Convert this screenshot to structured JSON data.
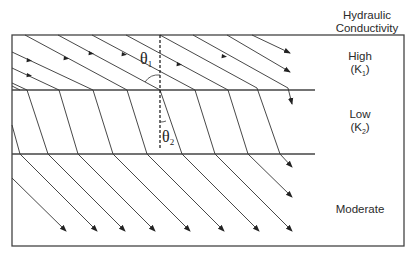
{
  "figure": {
    "header_label": [
      "Hydraulic",
      "Conductivity"
    ],
    "layers": [
      {
        "name": "High",
        "symbol": "K",
        "subscript": "1",
        "y_top": 35,
        "y_bottom": 90
      },
      {
        "name": "Low",
        "symbol": "K",
        "subscript": "2",
        "y_top": 90,
        "y_bottom": 154
      },
      {
        "name": "Moderate",
        "symbol": "",
        "subscript": "",
        "y_top": 154,
        "y_bottom": 246
      }
    ],
    "angles": [
      {
        "symbol": "θ",
        "subscript": "1",
        "description": "angle of incidence in high-K layer"
      },
      {
        "symbol": "θ",
        "subscript": "2",
        "description": "angle of refraction in low-K layer"
      }
    ],
    "colors": {
      "line": "#333333",
      "frame": "#444444",
      "text": "#2a2a2a"
    },
    "labels": {
      "high": "High",
      "high_k": "(K",
      "high_sub": "1",
      "low": "Low",
      "low_k": "(K",
      "low_sub": "2",
      "moderate": "Moderate",
      "close_paren": ")",
      "theta": "θ",
      "theta1_sub": "1",
      "theta2_sub": "2",
      "header_line1": "Hydraulic",
      "header_line2": "Conductivity"
    }
  }
}
